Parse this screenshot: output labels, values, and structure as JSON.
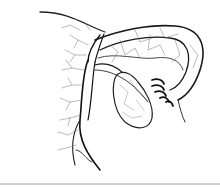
{
  "image": {
    "subject": "Anatomical line illustration of ovary, fallopian tube with fimbriae, and branching blood vessels",
    "background_color": "#ffffff",
    "stroke_color": "#1a1a1a",
    "fine_vessel_color": "#555555",
    "bottom_rule_color": "#cfcfcf"
  }
}
